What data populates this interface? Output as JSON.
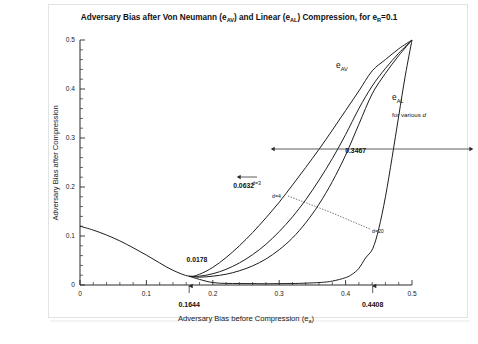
{
  "figure": {
    "title": "Adversary Bias after Von Neumann (e",
    "title_sub1": "AV",
    "title_mid": ") and Linear (e",
    "title_sub2": "AL",
    "title_end": ") Compression, for e",
    "title_sub3": "R",
    "title_tail": "=0.1",
    "title_full": "Adversary Bias after Von Neumann (eAV) and Linear (eAL) Compression, for eR=0.1"
  },
  "chart_data": {
    "type": "line",
    "title": "Adversary Bias after Von Neumann (eAV) and Linear (eAL) Compression, for eR=0.1",
    "xlabel": "Adversary Bias before Compression (ea)",
    "ylabel": "Adversary Bias after Compression",
    "xlim": [
      0,
      0.5
    ],
    "ylim": [
      0,
      0.5
    ],
    "xticks": [
      "0",
      "0.1",
      "0.2",
      "0.3",
      "0.4",
      "0.5"
    ],
    "xtick_values": [
      0,
      0.1,
      0.2,
      0.3,
      0.4,
      0.5
    ],
    "yticks": [
      "0",
      "0.1",
      "0.2",
      "0.3",
      "0.4",
      "0.5"
    ],
    "ytick_values": [
      0,
      0.1,
      0.2,
      0.3,
      0.4,
      0.5
    ],
    "minor_ticks_per_interval": 5,
    "grid": false,
    "legend": "inline-labels",
    "series": [
      {
        "name": "eAV",
        "label": "e",
        "label_sub": "AV",
        "points": [
          [
            0.0,
            0.12
          ],
          [
            0.02,
            0.112
          ],
          [
            0.04,
            0.102
          ],
          [
            0.06,
            0.09
          ],
          [
            0.08,
            0.076
          ],
          [
            0.1,
            0.061
          ],
          [
            0.12,
            0.045
          ],
          [
            0.14,
            0.03
          ],
          [
            0.1644,
            0.0178
          ],
          [
            0.18,
            0.022
          ],
          [
            0.2,
            0.036
          ],
          [
            0.22,
            0.056
          ],
          [
            0.24,
            0.08
          ],
          [
            0.26,
            0.107
          ],
          [
            0.28,
            0.137
          ],
          [
            0.3,
            0.169
          ],
          [
            0.32,
            0.204
          ],
          [
            0.34,
            0.24
          ],
          [
            0.36,
            0.277
          ],
          [
            0.38,
            0.316
          ],
          [
            0.4,
            0.356
          ],
          [
            0.42,
            0.396
          ],
          [
            0.44,
            0.437
          ],
          [
            0.46,
            0.46
          ],
          [
            0.48,
            0.482
          ],
          [
            0.5,
            0.5
          ]
        ]
      },
      {
        "name": "eAL d=3",
        "label": "d=3",
        "points": [
          [
            0.1644,
            0.0178
          ],
          [
            0.18,
            0.018
          ],
          [
            0.2,
            0.023
          ],
          [
            0.22,
            0.032
          ],
          [
            0.24,
            0.045
          ],
          [
            0.26,
            0.062
          ],
          [
            0.28,
            0.083
          ],
          [
            0.3,
            0.109
          ],
          [
            0.32,
            0.139
          ],
          [
            0.34,
            0.174
          ],
          [
            0.36,
            0.214
          ],
          [
            0.38,
            0.258
          ],
          [
            0.4,
            0.307
          ],
          [
            0.42,
            0.36
          ],
          [
            0.44,
            0.406
          ],
          [
            0.46,
            0.442
          ],
          [
            0.48,
            0.473
          ],
          [
            0.5,
            0.5
          ]
        ]
      },
      {
        "name": "eAL d=4",
        "label": "d=4",
        "points": [
          [
            0.1644,
            0.0178
          ],
          [
            0.18,
            0.016
          ],
          [
            0.2,
            0.018
          ],
          [
            0.22,
            0.022
          ],
          [
            0.24,
            0.029
          ],
          [
            0.26,
            0.039
          ],
          [
            0.28,
            0.053
          ],
          [
            0.3,
            0.072
          ],
          [
            0.32,
            0.096
          ],
          [
            0.34,
            0.127
          ],
          [
            0.36,
            0.165
          ],
          [
            0.38,
            0.211
          ],
          [
            0.4,
            0.265
          ],
          [
            0.42,
            0.328
          ],
          [
            0.44,
            0.39
          ],
          [
            0.46,
            0.432
          ],
          [
            0.48,
            0.468
          ],
          [
            0.5,
            0.5
          ]
        ]
      },
      {
        "name": "eAL d=20",
        "label": "d=20",
        "points": [
          [
            0.1644,
            0.0178
          ],
          [
            0.2,
            0.005
          ],
          [
            0.24,
            0.003
          ],
          [
            0.28,
            0.0025
          ],
          [
            0.32,
            0.003
          ],
          [
            0.36,
            0.005
          ],
          [
            0.38,
            0.008
          ],
          [
            0.4,
            0.015
          ],
          [
            0.41,
            0.022
          ],
          [
            0.42,
            0.034
          ],
          [
            0.43,
            0.055
          ],
          [
            0.4408,
            0.0741
          ],
          [
            0.45,
            0.115
          ],
          [
            0.46,
            0.18
          ],
          [
            0.47,
            0.26
          ],
          [
            0.48,
            0.345
          ],
          [
            0.49,
            0.428
          ],
          [
            0.5,
            0.5
          ]
        ]
      }
    ],
    "annotations": [
      {
        "name": "crossing-value",
        "text": "0.0178",
        "x": 0.1644,
        "y": 0.0178
      },
      {
        "name": "av-gap-value",
        "text": "0.0632",
        "x": 0.262,
        "y": 0.112
      },
      {
        "name": "al-gap-value",
        "text": "0.3467",
        "x": 0.4408,
        "y": 0.23
      },
      {
        "name": "x-marker-left",
        "text": "0.1644",
        "x": 0.1644,
        "y": 0
      },
      {
        "name": "x-marker-right",
        "text": "0.4408",
        "x": 0.4408,
        "y": 0
      }
    ],
    "curve_labels": [
      {
        "name": "eav-label",
        "text": "e",
        "sub": "AV"
      },
      {
        "name": "eal-label",
        "text": "e",
        "sub": "AL"
      },
      {
        "name": "for-various-d",
        "text": "for various ",
        "italic": "d"
      },
      {
        "name": "d3-label",
        "text": "d=3"
      },
      {
        "name": "d4-label",
        "text": "d=4"
      },
      {
        "name": "d20-label",
        "text": "d=20"
      }
    ]
  },
  "axes": {
    "y_title": "Adversary Bias after Compression",
    "x_title": "Adversary Bias before Compression (e",
    "x_title_sub": "a",
    "x_title_end": ")"
  }
}
